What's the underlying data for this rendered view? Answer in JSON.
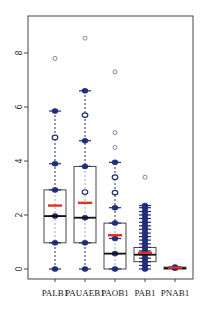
{
  "chart_data": {
    "type": "box",
    "title": "",
    "xlabel": "",
    "ylabel": "",
    "ylim": [
      -0.4,
      9.3
    ],
    "yticks": [
      0,
      2,
      4,
      6,
      8
    ],
    "ytick_labels": [
      "0",
      "2",
      "4",
      "6",
      "8"
    ],
    "categories": [
      "PALB1",
      "PAUAEB1",
      "PAOB1",
      "PAB1",
      "PNAB1"
    ],
    "colors": {
      "box": "#333333",
      "median": "#111111",
      "mean": "#e0301e",
      "point": "#1f2d7a",
      "outlier": "#5a6aa0"
    },
    "boxes": [
      {
        "name": "PALB1",
        "q1": 0.97,
        "median": 1.96,
        "q3": 2.93,
        "mean": 2.35,
        "whisker_low": 0,
        "whisker_high": 5.85,
        "points": [
          0,
          0.97,
          1.96,
          2.93,
          3.9,
          5.85
        ],
        "hollow_points": [
          4.87
        ],
        "outliers": [
          7.8
        ]
      },
      {
        "name": "PAUAEB1",
        "q1": 0.97,
        "median": 1.9,
        "q3": 3.8,
        "mean": 2.45,
        "whisker_low": 0,
        "whisker_high": 6.6,
        "points": [
          0,
          0.97,
          1.9,
          3.8,
          4.75,
          6.6
        ],
        "hollow_points": [
          2.85,
          5.7
        ],
        "outliers": [
          8.55
        ]
      },
      {
        "name": "PAOB1",
        "q1": 0,
        "median": 0.57,
        "q3": 1.7,
        "mean": 1.25,
        "whisker_low": 0,
        "whisker_high": 3.95,
        "points": [
          0,
          0.57,
          1.13,
          1.7,
          2.27,
          3.95
        ],
        "hollow_points": [
          2.83,
          3.4
        ],
        "outliers": [
          4.5,
          5.05,
          7.3
        ]
      },
      {
        "name": "PAB1",
        "q1": 0.27,
        "median": 0.53,
        "q3": 0.8,
        "mean": 0.6,
        "whisker_low": 0,
        "whisker_high": 2.35,
        "points": [
          0,
          0.13,
          0.27,
          0.4,
          0.53,
          0.67,
          0.8,
          0.93,
          1.07,
          1.2,
          1.33,
          1.47,
          1.6,
          1.73,
          1.87,
          2.0,
          2.13,
          2.27,
          2.35
        ],
        "hollow_points": [],
        "outliers": [
          3.4
        ]
      },
      {
        "name": "PNAB1",
        "q1": 0,
        "median": 0.03,
        "q3": 0.07,
        "mean": 0.05,
        "whisker_low": 0,
        "whisker_high": 0.1,
        "points": [
          0.03,
          0.07
        ],
        "hollow_points": [],
        "outliers": []
      }
    ]
  }
}
